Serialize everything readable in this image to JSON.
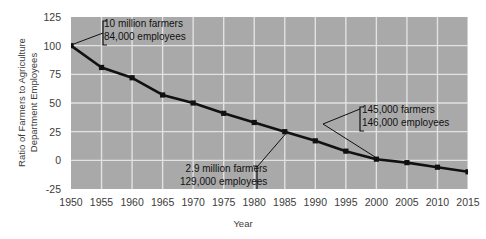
{
  "chart_data": {
    "type": "line",
    "title": "",
    "xlabel": "Year",
    "ylabel": "Ratio of Farmers to Agriculture\nDepartment Employees",
    "x": [
      1950,
      1955,
      1960,
      1965,
      1970,
      1975,
      1980,
      1985,
      1990,
      1995,
      2000,
      2005,
      2010,
      2015
    ],
    "values": [
      100,
      81,
      72,
      57,
      50,
      41,
      33,
      25,
      17,
      8,
      1,
      -2,
      -6,
      -10
    ],
    "xlim": [
      1950,
      2015
    ],
    "ylim": [
      -25,
      125
    ],
    "yticks": [
      125,
      100,
      75,
      50,
      25,
      0,
      -25
    ],
    "xticks": [
      "1950",
      "1955",
      "1960",
      "1965",
      "1970",
      "1975",
      "1980",
      "1985",
      "1990",
      "1995",
      "2000",
      "2005",
      "2010",
      "2015"
    ],
    "grid": true,
    "legend": "none",
    "series_color": "#111111",
    "panel_color": "#a9a9a9",
    "grid_color": "#e2e2e2",
    "annotations": [
      {
        "name": "annotation-1950",
        "bracket": "left",
        "lines": [
          "10 million farmers",
          "84,000 employees"
        ],
        "target_x": 1950,
        "target_y": 100
      },
      {
        "name": "annotation-1985",
        "bracket": "right",
        "lines": [
          "2.9 million farmers",
          "129,000 employees"
        ],
        "target_x": 1985,
        "target_y": 25
      },
      {
        "name": "annotation-2000",
        "bracket": "left",
        "lines": [
          "145,000 farmers",
          "146,000 employees"
        ],
        "target_x": 2000,
        "target_y": 1
      }
    ]
  },
  "axis": {
    "ylabel_line1": "Ratio of Farmers to Agriculture",
    "ylabel_line2": "Department Employees",
    "xlabel": "Year"
  },
  "ytick_labels": [
    "125",
    "100",
    "75",
    "50",
    "25",
    "0",
    "-25"
  ],
  "annotation_text": {
    "a1_line1": "10 million farmers",
    "a1_line2": "84,000 employees",
    "a2_line1": "2.9 million farmers",
    "a2_line2": "129,000 employees",
    "a3_line1": "145,000 farmers",
    "a3_line2": "146,000 employees"
  }
}
